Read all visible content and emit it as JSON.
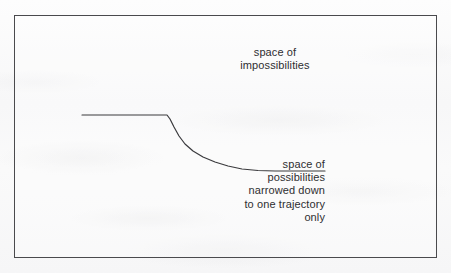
{
  "figure": {
    "kind": "line-diagram",
    "background_color": "#fbfbfb",
    "border_color": "#4a4a4d",
    "ink_color": "#2e2e31"
  },
  "labels": {
    "impossibilities": "space of\nimpossibilities",
    "possibilities": "space of\npossibilities\nnarrowed down\nto one trajectory\nonly"
  },
  "chart_data": {
    "type": "line",
    "title": "",
    "xlabel": "",
    "ylabel": "",
    "grid": false,
    "legend": null,
    "axis_box": {
      "left": 14,
      "top": 15,
      "right": 437,
      "bottom": 258
    },
    "xlim": [
      14,
      437
    ],
    "ylim": [
      258,
      15
    ],
    "annotations": [
      {
        "text": "space of impossibilities",
        "lines": [
          "space of",
          "impossibilities"
        ],
        "x": 275,
        "y": 61,
        "align": "center"
      },
      {
        "text": "space of possibilities narrowed down to one trajectory only",
        "lines": [
          "space of",
          "possibilities",
          "narrowed down",
          "to one trajectory",
          "only"
        ],
        "x": 325,
        "y": 190,
        "align": "right"
      }
    ],
    "series": [
      {
        "name": "trajectory-boundary",
        "stroke": "#3a3a3d",
        "width": 1.2,
        "points": [
          [
            82,
            115
          ],
          [
            120,
            115
          ],
          [
            150,
            115
          ],
          [
            167,
            115
          ],
          [
            170,
            119
          ],
          [
            174,
            127
          ],
          [
            179,
            136
          ],
          [
            185,
            144
          ],
          [
            193,
            151
          ],
          [
            203,
            157
          ],
          [
            215,
            162
          ],
          [
            228,
            166
          ],
          [
            242,
            169
          ],
          [
            258,
            170.5
          ],
          [
            275,
            171
          ],
          [
            300,
            171
          ],
          [
            325,
            171
          ]
        ]
      }
    ]
  }
}
